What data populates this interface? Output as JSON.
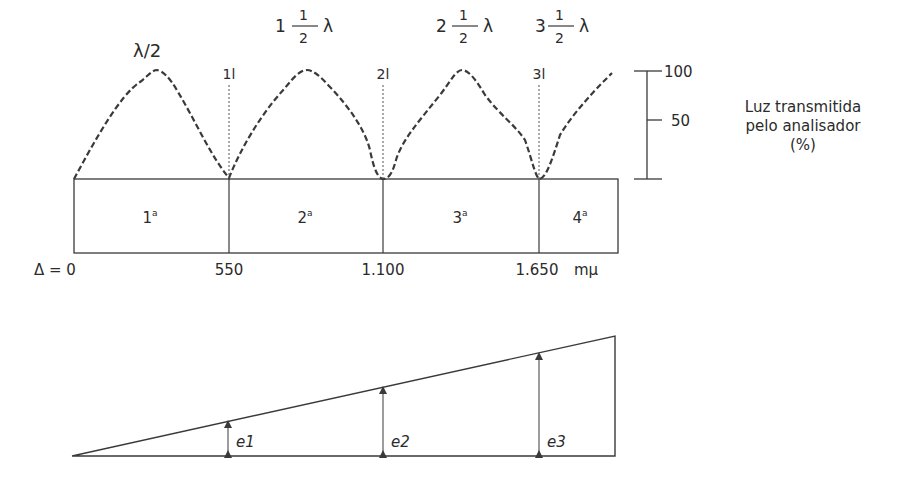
{
  "diagram": {
    "peak_labels": [
      {
        "whole": "",
        "num": "",
        "den": "",
        "text": "λ/2"
      },
      {
        "whole": "1",
        "num": "1",
        "den": "2",
        "lambda": "λ"
      },
      {
        "whole": "2",
        "num": "1",
        "den": "2",
        "lambda": "λ"
      },
      {
        "whole": "3",
        "num": "1",
        "den": "2",
        "lambda": "λ"
      }
    ],
    "order_marks": [
      "1l",
      "2l",
      "3l"
    ],
    "orders": [
      "1",
      "2",
      "3",
      "4"
    ],
    "order_suffix": "a",
    "retardation_labels": [
      "Δ = 0",
      "550",
      "1.100",
      "1.650",
      "mμ"
    ],
    "scale": {
      "ticks": [
        "100",
        "50"
      ],
      "title_lines": [
        "Luz transmitida",
        "pelo analisador",
        "(%)"
      ]
    },
    "thickness_labels": [
      "e1",
      "e2",
      "e3"
    ],
    "line_color": "#3a3a3a"
  }
}
